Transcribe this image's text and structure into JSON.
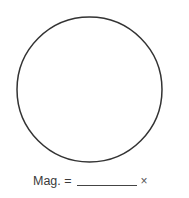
{
  "figure": {
    "shape": "circle",
    "center": [
      89.5,
      89.5
    ],
    "radius": 72.5,
    "stroke_color": "#333333",
    "stroke_width": 1.5
  },
  "magnification": {
    "label": "Mag. =",
    "blank_value": "",
    "unit": "×"
  },
  "colors": {
    "background": "#ffffff",
    "text": "#3a3a3a"
  }
}
